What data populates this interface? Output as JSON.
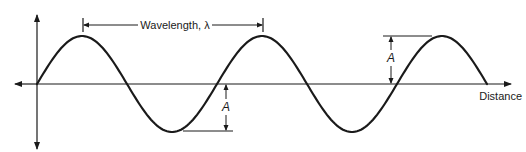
{
  "diagram": {
    "type": "sine-wave",
    "labels": {
      "wavelength": "Wavelength, λ",
      "amplitude_upper": "A",
      "amplitude_lower": "A",
      "x_axis": "Distance"
    },
    "colors": {
      "stroke": "#1a1a1a",
      "background": "#ffffff"
    },
    "geometry": {
      "origin": [
        37,
        84
      ],
      "period_px": 180,
      "amplitude_px": 48,
      "cycles": 2.5
    }
  }
}
